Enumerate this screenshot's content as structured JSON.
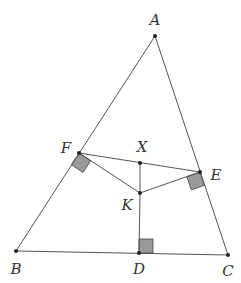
{
  "diagram": {
    "type": "geometry",
    "points": {
      "A": {
        "label": "A",
        "x": 155,
        "y": 36,
        "lx": 155,
        "ly": 25
      },
      "B": {
        "label": "B",
        "x": 16,
        "y": 251,
        "lx": 16,
        "ly": 274
      },
      "C": {
        "label": "C",
        "x": 228,
        "y": 255,
        "lx": 228,
        "ly": 276
      },
      "D": {
        "label": "D",
        "x": 139,
        "y": 253,
        "lx": 139,
        "ly": 274
      },
      "E": {
        "label": "E",
        "x": 200,
        "y": 172,
        "lx": 216,
        "ly": 180
      },
      "F": {
        "label": "F",
        "x": 79,
        "y": 153,
        "lx": 66,
        "ly": 153
      },
      "X": {
        "label": "X",
        "x": 140,
        "y": 163,
        "lx": 142,
        "ly": 152
      },
      "K": {
        "label": "K",
        "x": 140,
        "y": 193,
        "lx": 127,
        "ly": 210
      }
    },
    "segments": [
      "AB",
      "BC",
      "CA",
      "FE",
      "FK",
      "EK",
      "XK",
      "KD"
    ],
    "right_angles": [
      "F",
      "E",
      "D"
    ],
    "colors": {
      "line": "#555555",
      "point": "#222222",
      "right_angle_fill": "#9a9a9a",
      "label": "#333333"
    }
  }
}
